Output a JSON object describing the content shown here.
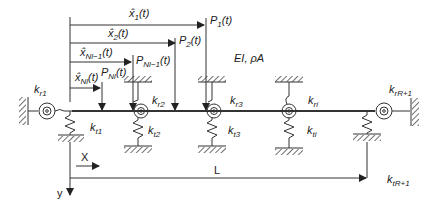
{
  "diagram": {
    "beam_property": "EI, ρA",
    "moving_loads": [
      {
        "position_label": "x̂1(t)",
        "load_label": "P1(t)"
      },
      {
        "position_label": "x̂2(t)",
        "load_label": "P2(t)"
      },
      {
        "position_label": "x̂Nl−1(t)",
        "load_label": "PNl−1(t)"
      },
      {
        "position_label": "x̂Nl(t)",
        "load_label": "PNl(t)"
      }
    ],
    "rotational_springs": [
      "kr1",
      "kr2",
      "kr3",
      "kri",
      "krR+1"
    ],
    "translational_springs": [
      "kt1",
      "kt2",
      "kt3",
      "kti",
      "ktR+1"
    ],
    "axes": {
      "x_label": "X",
      "y_label": "y",
      "length_label": "L"
    }
  },
  "labels": {
    "x1": {
      "base": "x̂",
      "sub": "1",
      "tail": "(t)"
    },
    "x2": {
      "base": "x̂",
      "sub": "2",
      "tail": "(t)"
    },
    "xn1": {
      "base": "x̂",
      "sub": "Nl−1",
      "tail": "(t)"
    },
    "xn": {
      "base": "x̂",
      "sub": "Nl",
      "tail": "(t)"
    },
    "p1": {
      "base": "P",
      "sub": "1",
      "tail": "(t)"
    },
    "p2": {
      "base": "P",
      "sub": "2",
      "tail": "(t)"
    },
    "pn1": {
      "base": "P",
      "sub": "Nl−1",
      "tail": "(t)"
    },
    "pn": {
      "base": "P",
      "sub": "Nl",
      "tail": "(t)"
    },
    "ei": "EI, ρA",
    "kr1": {
      "base": "k",
      "sub": "r1"
    },
    "kr2": {
      "base": "k",
      "sub": "r2"
    },
    "kr3": {
      "base": "k",
      "sub": "r3"
    },
    "kri": {
      "base": "k",
      "sub": "ri"
    },
    "krR1": {
      "base": "k",
      "sub": "rR+1"
    },
    "kt1": {
      "base": "k",
      "sub": "t1"
    },
    "kt2": {
      "base": "k",
      "sub": "t2"
    },
    "kt3": {
      "base": "k",
      "sub": "t3"
    },
    "kti": {
      "base": "k",
      "sub": "ti"
    },
    "ktR1": {
      "base": "k",
      "sub": "tR+1"
    },
    "X": "X",
    "y": "y",
    "L": "L"
  }
}
